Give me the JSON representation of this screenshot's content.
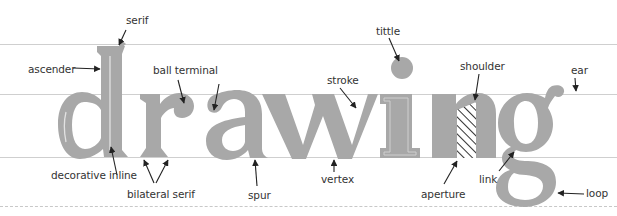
{
  "diagram": {
    "word": "drawing",
    "letter_color": "#a8a8a8",
    "inline_color": "#e2e2e2",
    "guide_color": "#cfcfcf",
    "label_color": "#333333",
    "guides": [
      {
        "name": "ascender-line",
        "y": 44,
        "style": "solid"
      },
      {
        "name": "x-height-line",
        "y": 94,
        "style": "solid"
      },
      {
        "name": "baseline",
        "y": 157,
        "style": "solid"
      },
      {
        "name": "descender-line",
        "y": 206,
        "style": "dashed"
      }
    ],
    "labels": {
      "serif": "serif",
      "ascender": "ascender",
      "ball_terminal": "ball terminal",
      "decorative_inline": "decorative inline",
      "bilateral_serif": "bilateral serif",
      "spur": "spur",
      "stroke": "stroke",
      "vertex": "vertex",
      "tittle": "tittle",
      "shoulder": "shoulder",
      "aperture": "aperture",
      "ear": "ear",
      "link": "link",
      "loop": "loop"
    }
  }
}
